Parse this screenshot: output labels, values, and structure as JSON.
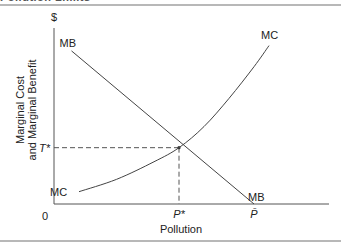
{
  "figure": {
    "heading": "Pollution Limits"
  },
  "chart_data": {
    "type": "line",
    "title": "",
    "xlabel": "Pollution",
    "ylabel": "Marginal Cost\nand Marginal Benefit",
    "ylabel_lines": [
      "Marginal Cost",
      "and Marginal Benefit"
    ],
    "y_unit_label": "$",
    "origin_label": "0",
    "xlim": [
      0,
      1.1
    ],
    "ylim": [
      0,
      1.0
    ],
    "grid": false,
    "legend": "none",
    "series": [
      {
        "name": "MB",
        "label_start": "MB",
        "label_end": "MB",
        "shape": "linear-decreasing",
        "points": [
          [
            0.07,
            0.87
          ],
          [
            0.8,
            0.0
          ]
        ]
      },
      {
        "name": "MC",
        "label_start": "MC",
        "label_end": "MC",
        "shape": "convex-increasing",
        "points": [
          [
            0.1,
            0.07
          ],
          [
            0.25,
            0.14
          ],
          [
            0.4,
            0.24
          ],
          [
            0.5,
            0.32
          ],
          [
            0.6,
            0.44
          ],
          [
            0.7,
            0.6
          ],
          [
            0.8,
            0.78
          ],
          [
            0.86,
            0.9
          ]
        ]
      }
    ],
    "annotations": {
      "equilibrium": {
        "x": 0.5,
        "y": 0.32
      },
      "x_ticks": [
        {
          "value": 0.5,
          "label": "P*"
        },
        {
          "value": 0.8,
          "label": "P̄"
        }
      ],
      "y_ticks": [
        {
          "value": 0.32,
          "label": "T*"
        }
      ]
    }
  }
}
